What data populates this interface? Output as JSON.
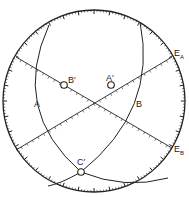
{
  "diagram": {
    "type": "stereographic-projection",
    "primitive_circle": {
      "cx": 94,
      "cy": 101,
      "r": 91
    },
    "colors": {
      "ink": "#222222",
      "background": "#ffffff"
    },
    "great_circles": [
      {
        "label": "A",
        "label_pos": [
          34,
          107
        ],
        "path": "M49,25 Q10,110 81,172 Q125,190 168,178"
      },
      {
        "label": "B",
        "label_pos": [
          136,
          107
        ],
        "path": "M140,22 Q158,110 81,172 Q60,184 48,186"
      }
    ],
    "diameters": [
      {
        "from": [
          16,
          57
        ],
        "to": [
          172,
          148
        ],
        "end_label": "E",
        "end_sub": "B",
        "label_pos": [
          173,
          160
        ]
      },
      {
        "from": [
          16,
          150
        ],
        "to": [
          172,
          57
        ],
        "end_label": "E",
        "end_sub": "A",
        "label_pos": [
          173,
          55
        ]
      }
    ],
    "points": [
      {
        "label": "B′",
        "x": 64,
        "y": 85,
        "label_pos": [
          68,
          83
        ]
      },
      {
        "label": "A′",
        "x": 111,
        "y": 85,
        "label_pos": [
          107,
          81
        ]
      },
      {
        "label": "C′",
        "x": 81,
        "y": 172,
        "label_pos": [
          77,
          164
        ]
      }
    ],
    "labels": {
      "A": "A",
      "B": "B",
      "E": "E",
      "EA_sub": "A",
      "EB_sub": "B",
      "A_prime": "A′",
      "B_prime": "B′",
      "C_prime": "C′"
    }
  }
}
